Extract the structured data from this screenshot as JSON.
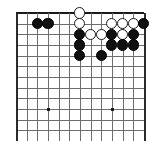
{
  "diagram": {
    "kind": "go-board-diagram",
    "board_label": "Go board",
    "columns": 13,
    "rows": 12,
    "cell_size": 10.65,
    "origin_x": 16,
    "origin_y": 13,
    "stone_radius": 5.6,
    "colors": {
      "background": "#ffffff",
      "grid": "#6e6e6e",
      "edge": "#1a1a1a",
      "black_stone": "#111111",
      "white_stone": "#ffffff",
      "white_stone_outline": "#1a1a1a",
      "hoshi": "#1a1a1a"
    },
    "edges": {
      "top": true,
      "left": true,
      "right": true,
      "bottom": false
    },
    "hoshi_points": [
      {
        "col": 3,
        "row": 9
      },
      {
        "col": 9,
        "row": 9
      }
    ],
    "stones": [
      {
        "col": 6,
        "row": 0,
        "color": "white"
      },
      {
        "col": 2,
        "row": 1,
        "color": "black"
      },
      {
        "col": 3,
        "row": 1,
        "color": "black"
      },
      {
        "col": 6,
        "row": 1,
        "color": "white"
      },
      {
        "col": 9,
        "row": 1,
        "color": "white"
      },
      {
        "col": 10,
        "row": 1,
        "color": "white"
      },
      {
        "col": 11,
        "row": 1,
        "color": "white"
      },
      {
        "col": 12,
        "row": 1,
        "color": "black"
      },
      {
        "col": 6,
        "row": 2,
        "color": "black"
      },
      {
        "col": 7,
        "row": 2,
        "color": "white"
      },
      {
        "col": 8,
        "row": 2,
        "color": "white"
      },
      {
        "col": 9,
        "row": 2,
        "color": "black"
      },
      {
        "col": 10,
        "row": 2,
        "color": "white"
      },
      {
        "col": 11,
        "row": 2,
        "color": "black"
      },
      {
        "col": 6,
        "row": 3,
        "color": "black"
      },
      {
        "col": 9,
        "row": 3,
        "color": "black"
      },
      {
        "col": 10,
        "row": 3,
        "color": "black"
      },
      {
        "col": 11,
        "row": 3,
        "color": "black"
      },
      {
        "col": 6,
        "row": 4,
        "color": "black"
      },
      {
        "col": 8,
        "row": 4,
        "color": "black"
      }
    ],
    "counts": {
      "black_stones": 12,
      "white_stones": 8,
      "total_stones": 20
    }
  }
}
